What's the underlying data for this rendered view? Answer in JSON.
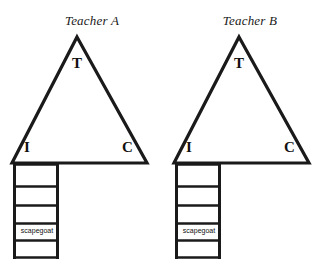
{
  "figure": {
    "background_color": "#ffffff",
    "stroke_color": "#1a1a1a",
    "text_color": "#111111",
    "panels": [
      {
        "id": "teacher-a",
        "title": "Teacher A",
        "triangle": {
          "apex_label": "T",
          "bottom_left_label": "I",
          "bottom_right_label": "C"
        },
        "ladder": {
          "rung_count": 5,
          "highlighted_cell_label": "scapegoat"
        }
      },
      {
        "id": "teacher-b",
        "title": "Teacher B",
        "triangle": {
          "apex_label": "T",
          "bottom_left_label": "I",
          "bottom_right_label": "C"
        },
        "ladder": {
          "rung_count": 5,
          "highlighted_cell_label": "scapegoat"
        }
      }
    ]
  }
}
